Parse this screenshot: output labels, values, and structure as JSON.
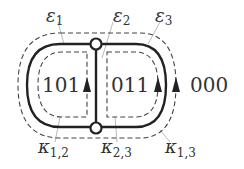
{
  "diagram": {
    "type": "graph-embedding",
    "nodes": [
      {
        "id": "top",
        "x": 96,
        "y": 44
      },
      {
        "id": "bottom",
        "x": 96,
        "y": 128
      }
    ],
    "edges": [
      {
        "label": "ε",
        "sub": "1",
        "name": "epsilon-1"
      },
      {
        "label": "ε",
        "sub": "2",
        "name": "epsilon-2"
      },
      {
        "label": "ε",
        "sub": "3",
        "name": "epsilon-3"
      }
    ],
    "faces": [
      {
        "code": "101",
        "name": "face-101"
      },
      {
        "code": "011",
        "name": "face-011"
      },
      {
        "code": "000",
        "name": "face-000"
      }
    ],
    "cycles": [
      {
        "label": "κ",
        "sub": "1,2",
        "name": "kappa-1-2"
      },
      {
        "label": "κ",
        "sub": "2,3",
        "name": "kappa-2-3"
      },
      {
        "label": "κ",
        "sub": "1,3",
        "name": "kappa-1-3"
      }
    ],
    "colors": {
      "solid": "#222222",
      "dashed": "#444444",
      "leader": "#bbbbbb",
      "text": "#333333"
    }
  }
}
